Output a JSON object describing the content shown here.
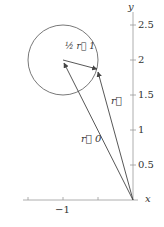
{
  "axes": {
    "x_label": "x",
    "y_label": "y",
    "x_ticks": [
      {
        "value": -1,
        "label": "−1"
      }
    ],
    "y_ticks": [
      {
        "value": 0.5,
        "label": "0.5"
      },
      {
        "value": 1,
        "label": "1"
      },
      {
        "value": 1.5,
        "label": "1.5"
      },
      {
        "value": 2,
        "label": "2"
      },
      {
        "value": 2.5,
        "label": "2.5"
      }
    ]
  },
  "circle": {
    "center": [
      -1,
      2
    ],
    "radius": 0.5
  },
  "vectors": {
    "r0": {
      "label": "r⃗ 0",
      "from": [
        0,
        0
      ],
      "to": [
        -1,
        2
      ]
    },
    "r": {
      "label": "r⃗",
      "from": [
        0,
        0
      ],
      "to": [
        -0.5,
        1.87
      ]
    },
    "half_r1": {
      "label": "½ r⃗ 1",
      "from": [
        -1,
        2
      ],
      "to": [
        -0.5,
        1.87
      ]
    }
  },
  "colors": {
    "stroke": "#444444",
    "axis": "#999999"
  }
}
